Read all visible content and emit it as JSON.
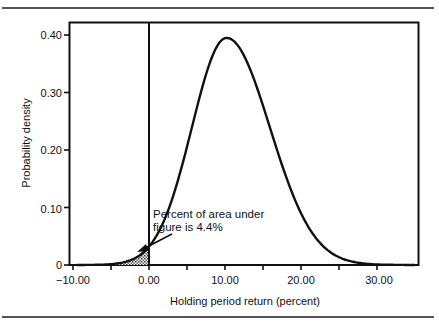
{
  "chart_data": {
    "type": "area",
    "title": "",
    "xlabel": "Holding period return (percent)",
    "ylabel": "Probability density",
    "xlim": [
      -10,
      35
    ],
    "ylim": [
      0,
      0.42
    ],
    "grid": false,
    "legend": null,
    "x_ticks": [
      -10,
      -5,
      0,
      5,
      10,
      15,
      20,
      25,
      30
    ],
    "x_tick_labels": [
      "−10.00",
      "0.00",
      "10.00",
      "20.00",
      "30.00"
    ],
    "x_tick_label_values": [
      -10,
      0,
      10,
      20,
      30
    ],
    "y_ticks": [
      0,
      0.1,
      0.2,
      0.3,
      0.4
    ],
    "y_tick_labels": [
      "0",
      "0.10",
      "0.20",
      "0.30",
      "0.40"
    ],
    "series": [
      {
        "name": "Normal distribution of holding period return",
        "distribution": "normal",
        "mean": 10.2,
        "peak_density": 0.395,
        "x": [
          -7,
          -6,
          -5,
          -4,
          -3,
          -2,
          -1,
          0,
          2,
          4,
          6,
          8,
          10,
          12,
          14,
          16,
          18,
          20,
          22,
          24,
          26,
          28,
          30,
          32,
          34
        ],
        "y": [
          0.003,
          0.01,
          0.018,
          0.03,
          0.045,
          0.062,
          0.081,
          0.1,
          0.15,
          0.214,
          0.29,
          0.36,
          0.395,
          0.375,
          0.305,
          0.222,
          0.15,
          0.095,
          0.057,
          0.032,
          0.017,
          0.008,
          0.004,
          0.002,
          0.0005
        ]
      }
    ],
    "shaded_region": {
      "x_from": -7,
      "x_to": 0,
      "pattern": "dotted",
      "label": "Percent of area under figure is 4.4%"
    },
    "vertical_line": {
      "x": 0
    },
    "annotations": [
      {
        "text_line1": "Percent of area under",
        "text_line2": "figure is 4.4%",
        "arrow_to": [
          -1.5,
          0.025
        ]
      }
    ]
  },
  "labels": {
    "ylabel": "Probability density",
    "xlabel": "Holding period return (percent)",
    "annotation_line1": "Percent of area under",
    "annotation_line2": "figure is 4.4%",
    "x_ticks": [
      "−10.00",
      "0.00",
      "10.00",
      "20.00",
      "30.00"
    ],
    "y_ticks": [
      "0",
      "0.10",
      "0.20",
      "0.30",
      "0.40"
    ]
  }
}
